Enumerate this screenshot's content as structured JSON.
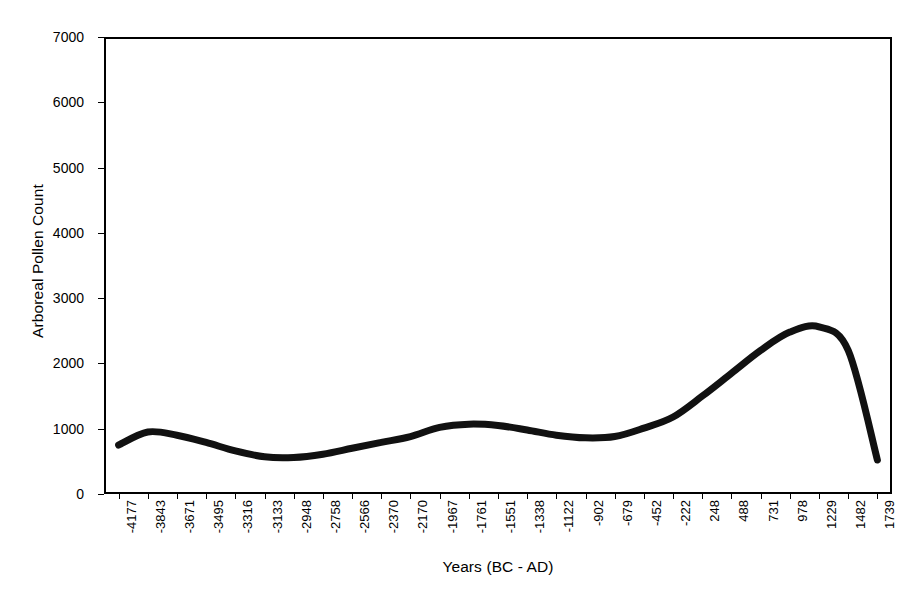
{
  "chart_data": {
    "type": "line",
    "title": "",
    "xlabel": "Years (BC - AD)",
    "ylabel": "Arboreal Pollen Count",
    "grid": false,
    "legend": "none",
    "ylim": [
      0,
      7000
    ],
    "y_ticks": [
      0,
      1000,
      2000,
      3000,
      4000,
      5000,
      6000,
      7000
    ],
    "categories": [
      "-4177",
      "-3843",
      "-3671",
      "-3495",
      "-3316",
      "-3133",
      "-2948",
      "-2758",
      "-2566",
      "-2370",
      "-2170",
      "-1967",
      "-1761",
      "-1551",
      "-1338",
      "-1122",
      "-902",
      "-679",
      "-452",
      "-222",
      "248",
      "488",
      "731",
      "978",
      "1229",
      "1482",
      "1739"
    ],
    "values": [
      750,
      950,
      900,
      790,
      660,
      570,
      560,
      610,
      700,
      790,
      880,
      1020,
      1070,
      1050,
      980,
      900,
      860,
      880,
      1010,
      1180,
      1500,
      1850,
      2200,
      2480,
      2560,
      2200,
      520
    ],
    "series_name": "Arboreal Pollen Count",
    "line_color": "#111111",
    "line_width": 7,
    "smoothing": "spline"
  },
  "axis": {
    "frame_color": "#000000",
    "background": "#ffffff"
  }
}
